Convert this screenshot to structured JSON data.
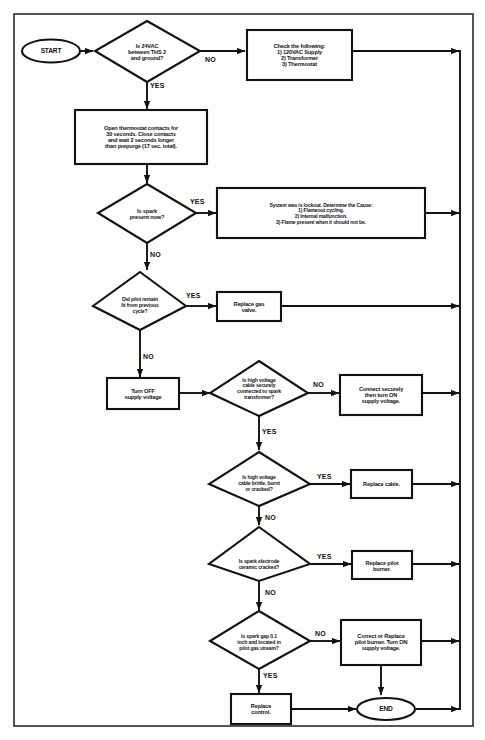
{
  "diagram": {
    "border_color": "#2b2b2b",
    "line_color": "#111111",
    "fill_color": "#ffffff"
  },
  "nodes": {
    "start": {
      "label": "START",
      "shape": "oval"
    },
    "q_24vac": {
      "label": "Is 24VAC\nbetween THS 2\nand ground?",
      "shape": "diamond"
    },
    "check_following": {
      "label": "Check the following:\n1) 120VAC Supply\n2) Transformer\n3) Thermostat",
      "shape": "rect"
    },
    "open_thermostat": {
      "label": "Open thermostat contacts for\n30 seconds. Close contacts\nand wait 2 seconds longer\nthan prepurge (17 sec. total).",
      "shape": "rect"
    },
    "q_spark_now": {
      "label": "Is spark\npresent now?",
      "shape": "diamond"
    },
    "lockout": {
      "label": "System was is lockout. Determine the Cause:\n1) Flameout cycling.\n2) Internal malfunction.\n3) Flame present when it should not be.",
      "shape": "rect"
    },
    "q_pilot_remain": {
      "label": "Did pilot remain\nlit from previous\ncycle?",
      "shape": "diamond"
    },
    "replace_gas_valve": {
      "label": "Replace gas\nvalve.",
      "shape": "rect"
    },
    "turn_off_supply": {
      "label": "Turn OFF\nsupply voltage",
      "shape": "rect"
    },
    "q_cable_connected": {
      "label": "Is high voltage\ncable securely\nconnected to spark\ntransformer?",
      "shape": "diamond"
    },
    "connect_securely": {
      "label": "Connect securely\nthen turn ON\nsupply voltage.",
      "shape": "rect"
    },
    "q_cable_brittle": {
      "label": "Is high voltage\ncable brittle, burnt\nor cracked?",
      "shape": "diamond"
    },
    "replace_cable": {
      "label": "Replace cable.",
      "shape": "rect"
    },
    "q_ceramic_cracked": {
      "label": "Is spark electrode\nceramic cracked?",
      "shape": "diamond"
    },
    "replace_pilot_burner": {
      "label": "Replace pilot\nburner.",
      "shape": "rect"
    },
    "q_spark_gap": {
      "label": "Is spark gap 0.1\ninch and located in\npilot gas stream?",
      "shape": "diamond"
    },
    "correct_or_replace": {
      "label": "Correct or Replace\npilot burner. Turn ON\nsupply voltage.",
      "shape": "rect"
    },
    "replace_control": {
      "label": "Replace\ncontrol.",
      "shape": "rect"
    },
    "end": {
      "label": "END",
      "shape": "oval"
    }
  },
  "edge_labels": {
    "no_24vac": "NO",
    "yes_24vac": "YES",
    "yes_spark_now": "YES",
    "no_spark_now": "NO",
    "yes_pilot_remain": "YES",
    "no_pilot_remain": "NO",
    "no_cable_connected": "NO",
    "yes_cable_connected": "YES",
    "yes_cable_brittle": "YES",
    "no_cable_brittle": "NO",
    "yes_ceramic_cracked": "YES",
    "no_ceramic_cracked": "NO",
    "no_spark_gap": "NO",
    "yes_spark_gap": "YES"
  }
}
